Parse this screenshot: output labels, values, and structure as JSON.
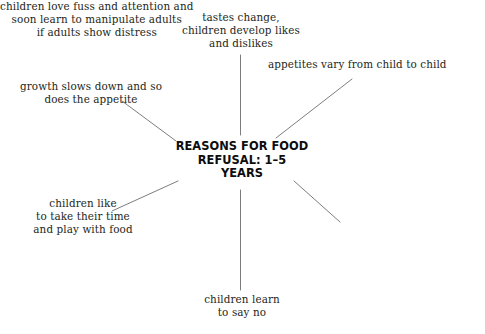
{
  "diagram": {
    "type": "mind-map",
    "title": "REASONS FOR FOOD\nREFUSAL: 1–5\nYEARS",
    "center_lines": [
      "REASONS FOR FOOD",
      "REFUSAL: 1–5",
      "YEARS"
    ],
    "colors": {
      "background": "#ffffff",
      "branch_text": "#231f20",
      "center_text": "#0d0d0d",
      "connector": "#6e6e6e"
    },
    "branches": [
      {
        "id": "tastes-change",
        "text": "tastes change,\nchildren develop likes\nand dislikes",
        "position": "top-center",
        "align": "center",
        "connector": "vertical"
      },
      {
        "id": "appetites-vary",
        "text": "appetites vary from child to child",
        "position": "top-right",
        "align": "left",
        "connector": "diagonal"
      },
      {
        "id": "growth-slows",
        "text": "growth slows down and so\ndoes the appetite",
        "position": "top-left",
        "align": "center",
        "connector": "diagonal"
      },
      {
        "id": "children-like",
        "text": "children like\nto take their time\nand play with food",
        "position": "bottom-left",
        "align": "center",
        "connector": "diagonal"
      },
      {
        "id": "children-love-fuss",
        "text": "children love fuss and attention and\nsoon learn to manipulate adults\nif adults show distress",
        "position": "bottom-right",
        "align": "center",
        "connector": "diagonal"
      },
      {
        "id": "children-learn",
        "text": "children learn\nto say no",
        "position": "bottom-center",
        "align": "center",
        "connector": "vertical"
      }
    ]
  }
}
